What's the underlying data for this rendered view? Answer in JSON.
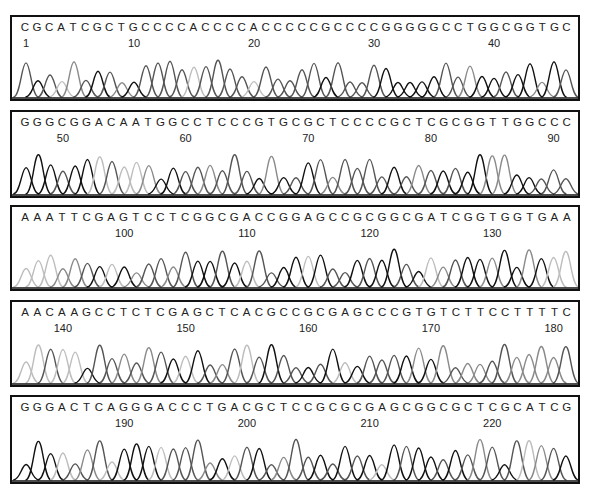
{
  "figure": {
    "type": "sanger-sequencing-chromatogram",
    "total_bases": 226,
    "trace_colors": {
      "A": "#bdbdbd",
      "C": "#555555",
      "G": "#111111",
      "T": "#8a8a8a"
    }
  },
  "panels": [
    {
      "start": 1,
      "sequence": "CGCATCGCTGCCCCACCCCACCCCCGCCCCGGGGGCCTGGCGGTGC",
      "tick_labels": [
        "1",
        "10",
        "20",
        "30",
        "40"
      ],
      "tick_positions": [
        1,
        10,
        20,
        30,
        40
      ]
    },
    {
      "start": 47,
      "sequence": "GGGCGGACAATGGCCTCCCGTGCGCTCCCCGCTCGCGGTTGGCCC",
      "tick_labels": [
        "50",
        "60",
        "70",
        "80",
        "90"
      ],
      "tick_positions": [
        50,
        60,
        70,
        80,
        90
      ]
    },
    {
      "start": 92,
      "sequence": "AAATTCGAGTCCTCGGCGACCGGAGCCGCGGCGATCGGTGGTGAA",
      "tick_labels": [
        "100",
        "110",
        "120",
        "130"
      ],
      "tick_positions": [
        100,
        110,
        120,
        130
      ]
    },
    {
      "start": 137,
      "sequence": "AACAAGCCTCTCGAGCTCACGCCGCGAGCCCGTGTCTTCCTTTTC",
      "tick_labels": [
        "140",
        "150",
        "160",
        "170",
        "180"
      ],
      "tick_positions": [
        140,
        150,
        160,
        170,
        180
      ]
    },
    {
      "start": 182,
      "sequence": "GGGACTCAGGGACCCTGACGCTCCGCGCGAGCGGCGCTCGCATCG",
      "tick_labels": [
        "190",
        "200",
        "210",
        "220"
      ],
      "tick_positions": [
        190,
        200,
        210,
        220
      ]
    }
  ]
}
